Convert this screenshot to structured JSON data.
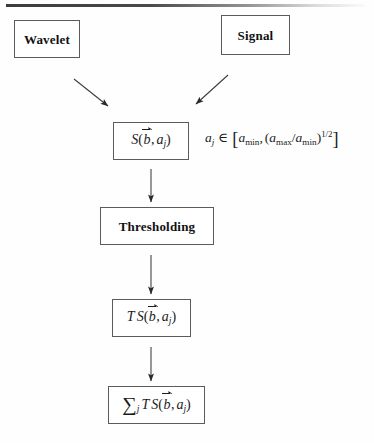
{
  "diagram": {
    "nodes": {
      "wavelet": {
        "label": "Wavelet"
      },
      "signal": {
        "label": "Signal"
      },
      "scalogram": {
        "math_plain": "S(b⃗, a_j)",
        "function": "S",
        "arg_vector": "b",
        "arg_scale": "a",
        "arg_scale_subscript": "j"
      },
      "thresholding": {
        "label": "Thresholding"
      },
      "thresholded": {
        "math_plain": "T S(b⃗, a_j)",
        "operator": "T",
        "function": "S",
        "arg_vector": "b",
        "arg_scale": "a",
        "arg_scale_subscript": "j"
      },
      "reconstruction": {
        "math_plain": "∑_j T S(b⃗, a_j)",
        "sum_symbol": "∑",
        "sum_index": "j",
        "operator": "T",
        "function": "S",
        "arg_vector": "b",
        "arg_scale": "a",
        "arg_scale_subscript": "j"
      }
    },
    "formula_range": {
      "plain": "a_j ∈ [a_min, (a_max/a_min)^(1/2)]",
      "variable": "a",
      "variable_subscript": "j",
      "member_symbol": "∈",
      "lower_bound_base": "a",
      "lower_bound_subscript": "min",
      "upper_numerator_base": "a",
      "upper_numerator_subscript": "max",
      "upper_denominator_base": "a",
      "upper_denominator_subscript": "min",
      "exponent": "1/2",
      "divider": "/",
      "open_bracket": "[",
      "close_bracket": "]",
      "comma": ","
    },
    "connectors": [
      {
        "name": "wavelet-to-scalogram",
        "style": "diagonal-arrow"
      },
      {
        "name": "signal-to-scalogram",
        "style": "diagonal-arrow"
      },
      {
        "name": "scalogram-to-thresholding",
        "style": "vertical-arrow"
      },
      {
        "name": "thresholding-to-thresholded",
        "style": "vertical-arrow"
      },
      {
        "name": "thresholded-to-reconstruction",
        "style": "vertical-arrow"
      }
    ],
    "colors": {
      "ink": "#1a1a1a",
      "border": "#5b5b5b",
      "page": "#fefefe"
    }
  }
}
